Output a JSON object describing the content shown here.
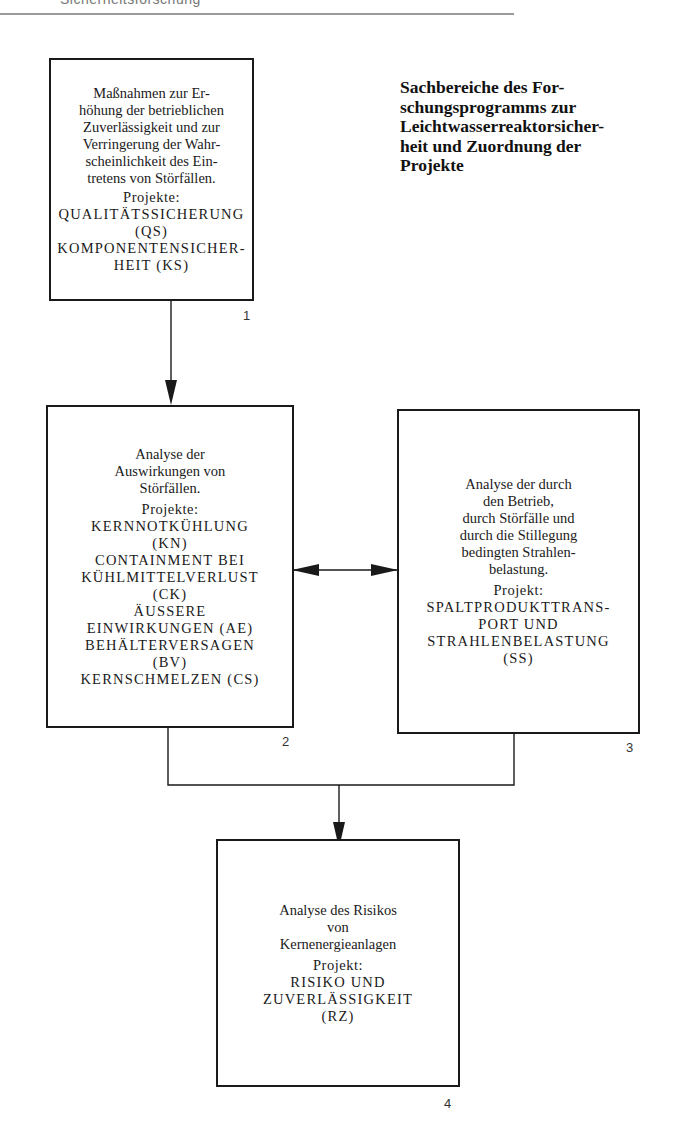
{
  "header": {
    "running_text": "Sicherheitsforschung"
  },
  "title": {
    "lines": [
      "Sachbereiche des For-",
      "schungsprogramms zur",
      "Leichtwasserreaktorsicher-",
      "heit und Zuordnung der",
      "Projekte"
    ]
  },
  "boxes": [
    {
      "number": "1",
      "description": [
        "Maßnahmen zur Er-",
        "höhung der betrieblichen",
        "Zuverlässigkeit und zur",
        "Verringerung der Wahr-",
        "scheinlichkeit des Ein-",
        "tretens von Störfällen."
      ],
      "projects_label": "Projekte:",
      "projects": [
        "QUALITÄTSSICHERUNG",
        "(QS)",
        "KOMPONENTENSICHER-",
        "HEIT (KS)"
      ]
    },
    {
      "number": "2",
      "description": [
        "Analyse der",
        "Auswirkungen von",
        "Störfällen."
      ],
      "projects_label": "Projekte:",
      "projects": [
        "KERNNOTKÜHLUNG",
        "(KN)",
        "CONTAINMENT BEI",
        "KÜHLMITTELVERLUST",
        "(CK)",
        "ÄUSSERE",
        "EINWIRKUNGEN (AE)",
        "BEHÄLTERVERSAGEN",
        "(BV)",
        "KERNSCHMELZEN (CS)"
      ]
    },
    {
      "number": "3",
      "description": [
        "Analyse der durch",
        "den Betrieb,",
        "durch Störfälle und",
        "durch die Stillegung",
        "bedingten Strahlen-",
        "belastung."
      ],
      "projects_label": "Projekt:",
      "projects": [
        "SPALTPRODUKTTRANS-",
        "PORT UND",
        "STRAHLENBELASTUNG",
        "(SS)"
      ]
    },
    {
      "number": "4",
      "description": [
        "Analyse des Risikos",
        "von",
        "Kernenergieanlagen"
      ],
      "projects_label": "Projekt:",
      "projects": [
        "RISIKO UND",
        "ZUVERLÄSSIGKEIT",
        "(RZ)"
      ]
    }
  ],
  "connections": [
    {
      "from": "1",
      "to": "2",
      "type": "arrow"
    },
    {
      "from": "2",
      "to": "3",
      "type": "bidirectional-arrow"
    },
    {
      "from": "2+3",
      "to": "4",
      "type": "merged-arrow"
    }
  ]
}
